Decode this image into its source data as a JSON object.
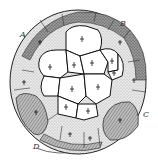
{
  "figure": {
    "type": "scientific-illustration",
    "background": "#ffffff",
    "ink": "#1a1a1a",
    "labels": [
      {
        "id": "A",
        "text": "A",
        "x": 20,
        "y": 31
      },
      {
        "id": "B",
        "text": "B",
        "x": 120,
        "y": 20
      },
      {
        "id": "C",
        "text": "C",
        "x": 143,
        "y": 111
      },
      {
        "id": "D",
        "text": "D",
        "x": 33,
        "y": 143
      }
    ],
    "regions": {
      "central_cells": "white cells with mitotic spindle marks",
      "outer_ring": "stippled and hatched cells"
    }
  }
}
